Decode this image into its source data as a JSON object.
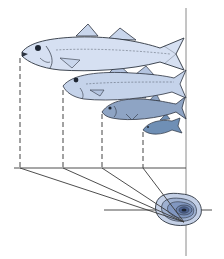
{
  "figure": {
    "title": "",
    "colors": {
      "background": "#ffffff",
      "line": "#3a3a3a",
      "axis": "#8a8a8a",
      "fish_large": "#c9d6ec",
      "fish_medium": "#b4c4e0",
      "fish_small": "#8ea4c4",
      "fish_smallest": "#6f8fb5",
      "fish_outline": "#2d3440",
      "otolith_outer": "#c4d0e6",
      "otolith_mid": "#9fb1d1",
      "otolith_inner": "#7a90b8",
      "otolith_core": "#1e2633"
    },
    "fish": [
      {
        "name": "fish-age-4",
        "mouth_x": 20,
        "mouth_y": 55
      },
      {
        "name": "fish-age-3",
        "mouth_x": 63,
        "mouth_y": 88
      },
      {
        "name": "fish-age-2",
        "mouth_x": 102,
        "mouth_y": 112
      },
      {
        "name": "fish-age-1",
        "mouth_x": 143,
        "mouth_y": 130
      }
    ],
    "baseline_y": 168,
    "otolith": {
      "cx": 183,
      "cy": 211,
      "rings": 6
    }
  }
}
